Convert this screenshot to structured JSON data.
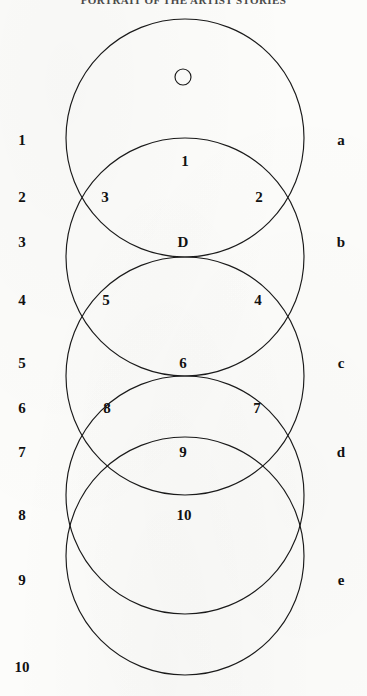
{
  "header": {
    "running_head": "PORTRAIT OF THE ARTIST STORIES"
  },
  "figure": {
    "stroke_color": "#1a1a1a",
    "fill_color": "none",
    "background_color": "#fcfcfa",
    "small_circle": {
      "label": "",
      "cx": 183,
      "cy": 77,
      "r": 8
    },
    "circles": [
      {
        "id": "a",
        "cx": 185,
        "cy": 138,
        "r": 119
      },
      {
        "id": "b",
        "cx": 185,
        "cy": 257,
        "r": 119
      },
      {
        "id": "c",
        "cx": 185,
        "cy": 376,
        "r": 119
      },
      {
        "id": "d",
        "cx": 185,
        "cy": 495,
        "r": 119
      },
      {
        "id": "e",
        "cx": 185,
        "cy": 556,
        "r": 119
      }
    ]
  },
  "left_scale": {
    "items": [
      {
        "label": "1",
        "y": 140
      },
      {
        "label": "2",
        "y": 197
      },
      {
        "label": "3",
        "y": 242
      },
      {
        "label": "4",
        "y": 300
      },
      {
        "label": "5",
        "y": 363
      },
      {
        "label": "6",
        "y": 408
      },
      {
        "label": "7",
        "y": 452
      },
      {
        "label": "8",
        "y": 515
      },
      {
        "label": "9",
        "y": 580
      },
      {
        "label": "10",
        "y": 667
      }
    ],
    "x": 22
  },
  "right_scale": {
    "items": [
      {
        "label": "a",
        "y": 140
      },
      {
        "label": "b",
        "y": 242
      },
      {
        "label": "c",
        "y": 363
      },
      {
        "label": "d",
        "y": 452
      },
      {
        "label": "e",
        "y": 580
      }
    ],
    "x": 341
  },
  "regions": [
    {
      "label": "1",
      "x": 185,
      "y": 161
    },
    {
      "label": "3",
      "x": 105,
      "y": 197
    },
    {
      "label": "2",
      "x": 259,
      "y": 197
    },
    {
      "label": "D",
      "x": 183,
      "y": 242
    },
    {
      "label": "5",
      "x": 106,
      "y": 300
    },
    {
      "label": "4",
      "x": 258,
      "y": 300
    },
    {
      "label": "6",
      "x": 183,
      "y": 363
    },
    {
      "label": "8",
      "x": 107,
      "y": 408
    },
    {
      "label": "7",
      "x": 257,
      "y": 408
    },
    {
      "label": "9",
      "x": 183,
      "y": 452
    },
    {
      "label": "10",
      "x": 184,
      "y": 515
    }
  ]
}
